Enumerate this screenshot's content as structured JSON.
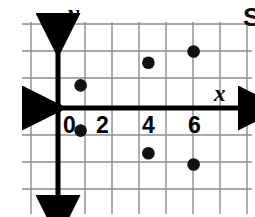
{
  "figure": {
    "kind": "coordinate-plane-scatter",
    "background_color": "#ffffff",
    "grid_color": "#8c8c8c",
    "axis_color": "#000000",
    "point_color": "#111111",
    "label_color": "#000000"
  },
  "axes": {
    "x_label": "x",
    "y_label": "y",
    "origin_label": "0",
    "x_tick_labels": [
      "2",
      "4",
      "6"
    ],
    "x_ticks": [
      2,
      4,
      6
    ],
    "x_range": [
      -1,
      7
    ],
    "y_range": [
      -3.2,
      3.2
    ],
    "grid": true,
    "grid_step": 1
  },
  "chart_data": {
    "type": "scatter",
    "title": "",
    "xlabel": "x",
    "ylabel": "y",
    "xlim": [
      -1,
      7
    ],
    "ylim": [
      -3.2,
      3.2
    ],
    "grid": true,
    "legend": "none",
    "points": [
      {
        "x": 1,
        "y": 1
      },
      {
        "x": 1,
        "y": -1
      },
      {
        "x": 4,
        "y": 2
      },
      {
        "x": 4,
        "y": -2
      },
      {
        "x": 6,
        "y": 2.5
      },
      {
        "x": 6,
        "y": -2.5
      }
    ],
    "tick_labels": {
      "x": [
        "0",
        "2",
        "4",
        "6"
      ]
    }
  },
  "cropped_text": {
    "right_edge_glyph": "S"
  }
}
